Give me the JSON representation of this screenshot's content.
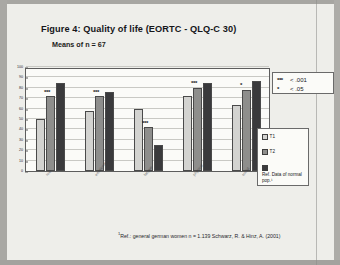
{
  "figure": {
    "title": "Figure 4: Quality of life  (EORTC - QLQ-C 30)",
    "subtitle": "Means of n = 67",
    "footnote_marker": "1",
    "footnote": "Ref.: general german women n = 1.139 Schwarz, R. & Hinz, A. (2001)"
  },
  "significance_key": {
    "items": [
      {
        "stars": "***",
        "threshold": "< .001"
      },
      {
        "stars": "*",
        "threshold": "< .05"
      }
    ]
  },
  "legend": {
    "items": [
      {
        "label": "T1",
        "color": "#d3d3d0"
      },
      {
        "label": "T2",
        "color": "#8e8e8c"
      },
      {
        "label": "Ref. Data of normal pop.¹",
        "color": "#3a3a3c"
      }
    ]
  },
  "chart_data": {
    "type": "bar",
    "title": "Figure 4: Quality of life  (EORTC - QLQ-C 30)",
    "subtitle": "Means of n = 67",
    "xlabel": "",
    "ylabel": "",
    "ylim": [
      0,
      100
    ],
    "yticks": [
      0,
      10,
      20,
      30,
      40,
      50,
      60,
      70,
      80,
      90,
      100
    ],
    "grid": true,
    "legend_position": "right",
    "categories": [
      "role",
      "emotional",
      "fatigue",
      "physical",
      "social"
    ],
    "series": [
      {
        "name": "T1",
        "color": "#d3d3d0",
        "values": [
          50,
          58,
          60,
          72,
          63
        ]
      },
      {
        "name": "T2",
        "color": "#8e8e8c",
        "values": [
          72,
          72,
          42,
          80,
          78
        ]
      },
      {
        "name": "Ref. Data of normal pop.¹",
        "color": "#3a3a3c",
        "values": [
          85,
          76,
          25,
          85,
          87
        ]
      }
    ],
    "annotations": [
      {
        "category": "role",
        "text": "***",
        "above_series": "T2"
      },
      {
        "category": "emotional",
        "text": "***",
        "above_series": "T2"
      },
      {
        "category": "fatigue",
        "text": "***",
        "above_series": "T2"
      },
      {
        "category": "physical",
        "text": "***",
        "above_series": "T2"
      },
      {
        "category": "social",
        "text": "*",
        "above_series": "T2"
      }
    ]
  }
}
